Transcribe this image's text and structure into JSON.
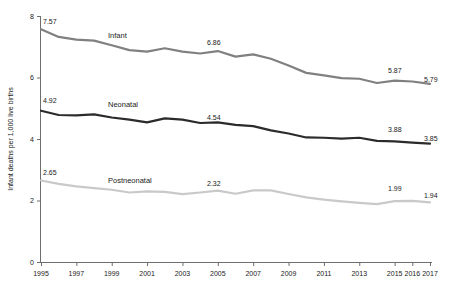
{
  "chart_data": {
    "type": "line",
    "title": "",
    "subtitle": "",
    "xlabel": "",
    "ylabel": "Infant deaths per 1,000 live births",
    "xlim": [
      1995,
      2017
    ],
    "ylim": [
      0,
      8
    ],
    "grid": false,
    "legend_position": "inline-annotation",
    "x": [
      1995,
      1996,
      1997,
      1998,
      1999,
      2000,
      2001,
      2002,
      2003,
      2004,
      2005,
      2006,
      2007,
      2008,
      2009,
      2010,
      2011,
      2012,
      2013,
      2014,
      2015,
      2016,
      2017
    ],
    "xticks": [
      "1995",
      "1997",
      "1999",
      "2001",
      "2003",
      "2005",
      "2007",
      "2009",
      "2011",
      "2013",
      "2015",
      "2016",
      "2017"
    ],
    "yticks": [
      "0",
      "2",
      "4",
      "6",
      "8"
    ],
    "series": [
      {
        "name": "Infant",
        "color": "#808080",
        "values": [
          7.57,
          7.32,
          7.23,
          7.2,
          7.05,
          6.89,
          6.84,
          6.95,
          6.84,
          6.78,
          6.86,
          6.68,
          6.75,
          6.61,
          6.39,
          6.15,
          6.07,
          5.98,
          5.96,
          5.82,
          5.9,
          5.87,
          5.79
        ]
      },
      {
        "name": "Neonatal",
        "color": "#2b2b2b",
        "values": [
          4.92,
          4.78,
          4.77,
          4.8,
          4.7,
          4.63,
          4.54,
          4.67,
          4.63,
          4.52,
          4.54,
          4.46,
          4.42,
          4.28,
          4.18,
          4.05,
          4.04,
          4.01,
          4.04,
          3.94,
          3.92,
          3.88,
          3.85
        ]
      },
      {
        "name": "Postneonatal",
        "color": "#c9c9c9",
        "values": [
          2.65,
          2.54,
          2.46,
          2.4,
          2.35,
          2.26,
          2.3,
          2.28,
          2.21,
          2.26,
          2.32,
          2.22,
          2.33,
          2.33,
          2.21,
          2.1,
          2.03,
          1.97,
          1.92,
          1.88,
          1.98,
          1.99,
          1.94
        ]
      }
    ],
    "point_labels": [
      {
        "series": "Infant",
        "x": 1995,
        "text": "7.57"
      },
      {
        "series": "Infant",
        "x": 2005,
        "text": "6.86"
      },
      {
        "series": "Infant",
        "x": 2016,
        "text": "5.87"
      },
      {
        "series": "Infant",
        "x": 2017,
        "text": "5.79"
      },
      {
        "series": "Neonatal",
        "x": 1995,
        "text": "4.92"
      },
      {
        "series": "Neonatal",
        "x": 2005,
        "text": "4.54"
      },
      {
        "series": "Neonatal",
        "x": 2016,
        "text": "3.88"
      },
      {
        "series": "Neonatal",
        "x": 2017,
        "text": "3.85"
      },
      {
        "series": "Postneonatal",
        "x": 1995,
        "text": "2.65"
      },
      {
        "series": "Postneonatal",
        "x": 2005,
        "text": "2.32"
      },
      {
        "series": "Postneonatal",
        "x": 2016,
        "text": "1.99"
      },
      {
        "series": "Postneonatal",
        "x": 2017,
        "text": "1.94"
      }
    ]
  },
  "axes": {
    "y_title": "Infant deaths per 1,000 live births",
    "y_ticks": [
      "8",
      "6",
      "4",
      "2",
      "0"
    ],
    "x_ticks": [
      "1995",
      "1997",
      "1999",
      "2001",
      "2003",
      "2005",
      "2007",
      "2009",
      "2011",
      "2013",
      "2015",
      "2016",
      "2017"
    ]
  },
  "series_labels": {
    "infant": "Infant",
    "neonatal": "Neonatal",
    "postneonatal": "Postneonatal"
  },
  "data_labels": {
    "infant_start": "7.57",
    "infant_mid": "6.86",
    "infant_2016": "5.87",
    "infant_2017": "5.79",
    "neonatal_start": "4.92",
    "neonatal_mid": "4.54",
    "neonatal_2016": "3.88",
    "neonatal_2017": "3.85",
    "postneonatal_start": "2.65",
    "postneonatal_mid": "2.32",
    "postneonatal_2016": "1.99",
    "postneonatal_2017": "1.94"
  },
  "colors": {
    "infant": "#808080",
    "neonatal": "#2b2b2b",
    "postneonatal": "#c9c9c9",
    "axis": "#6e6e6e",
    "text": "#1a1a1a",
    "background": "#ffffff"
  }
}
